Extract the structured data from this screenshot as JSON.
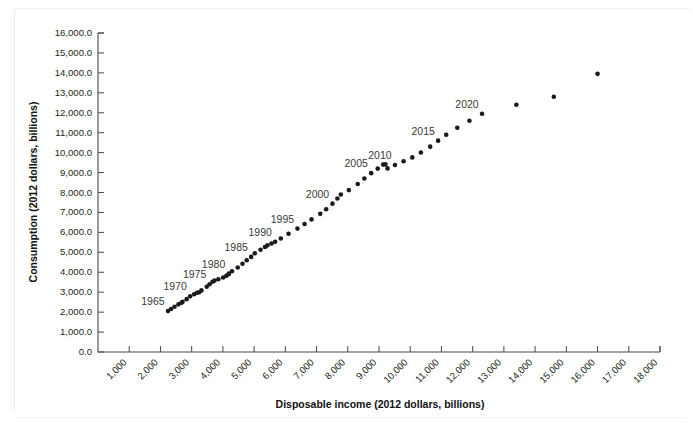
{
  "figure": {
    "width": 693,
    "height": 430,
    "background": "#ffffff",
    "point_color": "#1a1a1a",
    "axis_color": "#4a4a4a"
  },
  "chart_data": {
    "type": "scatter",
    "title": "",
    "xlabel": "Disposable income (2012 dollars, billions)",
    "ylabel": "Consumption (2012 dollars, billions)",
    "xlim": [
      0,
      18000
    ],
    "ylim": [
      0,
      16000
    ],
    "xticks": [
      1000,
      2000,
      3000,
      4000,
      5000,
      6000,
      7000,
      8000,
      9000,
      10000,
      11000,
      12000,
      13000,
      14000,
      15000,
      16000,
      17000,
      18000
    ],
    "xtick_labels": [
      "1,000",
      "2,000",
      "3,000",
      "4,000",
      "5,000",
      "6,000",
      "7,000",
      "8,000",
      "9,000",
      "10,000",
      "11,000",
      "12,000",
      "13,000",
      "14,000",
      "15,000",
      "16,000",
      "17,000",
      "18,000"
    ],
    "yticks": [
      0,
      1000,
      2000,
      3000,
      4000,
      5000,
      6000,
      7000,
      8000,
      9000,
      10000,
      11000,
      12000,
      13000,
      14000,
      15000,
      16000
    ],
    "ytick_labels": [
      "0.0",
      "1,000.0",
      "2,000.0",
      "3,000.0",
      "4,000.0",
      "5,000.0",
      "6,000.0",
      "7,000.0",
      "8,000.0",
      "9,000.0",
      "10,000.0",
      "11,000.0",
      "12,000.0",
      "13,000.0",
      "14,000.0",
      "15,000.0",
      "16,000.0"
    ],
    "xtick_label_rotation": -45,
    "grid": false,
    "legend": null,
    "x": [
      2241,
      2341,
      2452,
      2577,
      2674,
      2709,
      2840,
      2950,
      3079,
      3173,
      3241,
      3314,
      3483,
      3573,
      3669,
      3733,
      3854,
      4007,
      4110,
      4181,
      4192,
      4291,
      4476,
      4629,
      4764,
      4905,
      5022,
      5206,
      5348,
      5426,
      5558,
      5675,
      5856,
      6103,
      6388,
      6616,
      6839,
      7118,
      7307,
      7510,
      7668,
      7779,
      8034,
      8318,
      8531,
      8750,
      8959,
      9134,
      9205,
      9274,
      9511,
      9789,
      10066,
      10342,
      10640,
      10894,
      11152,
      11507,
      11897,
      12300,
      13400,
      14600,
      16000
    ],
    "y": [
      2055,
      2160,
      2270,
      2390,
      2470,
      2515,
      2650,
      2790,
      2900,
      2970,
      3000,
      3090,
      3270,
      3400,
      3520,
      3580,
      3650,
      3740,
      3820,
      3900,
      3930,
      4050,
      4240,
      4430,
      4600,
      4770,
      4950,
      5130,
      5270,
      5350,
      5440,
      5530,
      5690,
      5930,
      6190,
      6420,
      6650,
      6930,
      7160,
      7440,
      7700,
      7900,
      8120,
      8430,
      8700,
      8970,
      9200,
      9400,
      9410,
      9210,
      9380,
      9570,
      9760,
      10010,
      10300,
      10600,
      10900,
      11250,
      11600,
      11950,
      12400,
      12800,
      13950
    ],
    "annotations": [
      {
        "label": "1965",
        "x": 2241,
        "y": 2055
      },
      {
        "label": "1970",
        "x": 2950,
        "y": 2790
      },
      {
        "label": "1975",
        "x": 3573,
        "y": 3400
      },
      {
        "label": "1980",
        "x": 4181,
        "y": 3900
      },
      {
        "label": "1985",
        "x": 4905,
        "y": 4770
      },
      {
        "label": "1990",
        "x": 5675,
        "y": 5530
      },
      {
        "label": "1995",
        "x": 6388,
        "y": 6190
      },
      {
        "label": "2000",
        "x": 7510,
        "y": 7440
      },
      {
        "label": "2005",
        "x": 8750,
        "y": 8970
      },
      {
        "label": "2010",
        "x": 9511,
        "y": 9380
      },
      {
        "label": "2015",
        "x": 10894,
        "y": 10600
      },
      {
        "label": "2020",
        "x": 12300,
        "y": 11950
      }
    ]
  }
}
